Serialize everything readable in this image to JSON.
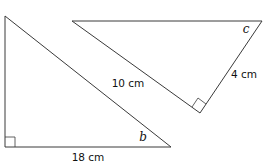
{
  "figures": [
    {
      "id": "triangle-1",
      "side_labels": {
        "base": "18 cm"
      },
      "angle_label": "b",
      "right_angle": true
    },
    {
      "id": "triangle-2",
      "side_labels": {
        "hypotenuse_leg": "10 cm",
        "short_leg": "4 cm"
      },
      "angle_label": "c",
      "right_angle": true
    }
  ],
  "colors": {
    "stroke": "#3a3a3a",
    "text": "#111111",
    "background": "#ffffff"
  }
}
